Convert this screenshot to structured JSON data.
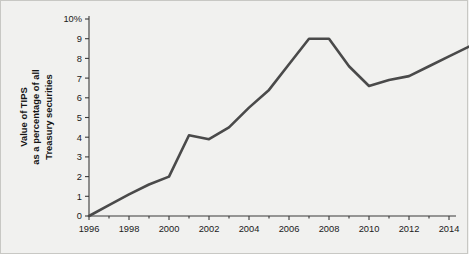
{
  "figure": {
    "background_color": "#f1f1ef",
    "border_color": "#c8c8c4"
  },
  "chart_data": {
    "type": "line",
    "title": "",
    "subtitle": "",
    "xlabel": "",
    "ylabel": "Value of TIPS as a percentage of all Treasury securities",
    "ylabel_lines": [
      "Value of TIPS",
      "as a percentage of all",
      "Treasury securities"
    ],
    "xlim": [
      1996,
      2015
    ],
    "ylim": [
      0,
      10
    ],
    "grid": false,
    "legend": null,
    "legend_position": "none",
    "line_color": "#4a4a4a",
    "line_width": 2.6,
    "x_tick_labels": [
      "1996",
      "1998",
      "2000",
      "2002",
      "2004",
      "2006",
      "2008",
      "2010",
      "2012",
      "2014"
    ],
    "x_tick_values": [
      1996,
      1998,
      2000,
      2002,
      2004,
      2006,
      2008,
      2010,
      2012,
      2014
    ],
    "x_minor_step": 1,
    "y_tick_labels": [
      "0",
      "1",
      "2",
      "3",
      "4",
      "5",
      "6",
      "7",
      "8",
      "9",
      "10%"
    ],
    "y_tick_values": [
      0,
      1,
      2,
      3,
      4,
      5,
      6,
      7,
      8,
      9,
      10
    ],
    "x": [
      1996,
      1997,
      1998,
      1999,
      2000,
      2001,
      2002,
      2003,
      2004,
      2005,
      2006,
      2007,
      2008,
      2009,
      2010,
      2011,
      2012,
      2013,
      2014,
      2015
    ],
    "values": [
      0.0,
      0.55,
      1.1,
      1.6,
      2.0,
      4.1,
      3.9,
      4.5,
      5.5,
      6.4,
      7.7,
      9.0,
      9.0,
      7.6,
      6.6,
      6.9,
      7.1,
      7.6,
      8.1,
      8.6
    ],
    "series": [
      {
        "name": "Value of TIPS as a percentage of all Treasury securities",
        "values": [
          0.0,
          0.55,
          1.1,
          1.6,
          2.0,
          4.1,
          3.9,
          4.5,
          5.5,
          6.4,
          7.7,
          9.0,
          9.0,
          7.6,
          6.6,
          6.9,
          7.1,
          7.6,
          8.1,
          8.6
        ]
      }
    ]
  }
}
